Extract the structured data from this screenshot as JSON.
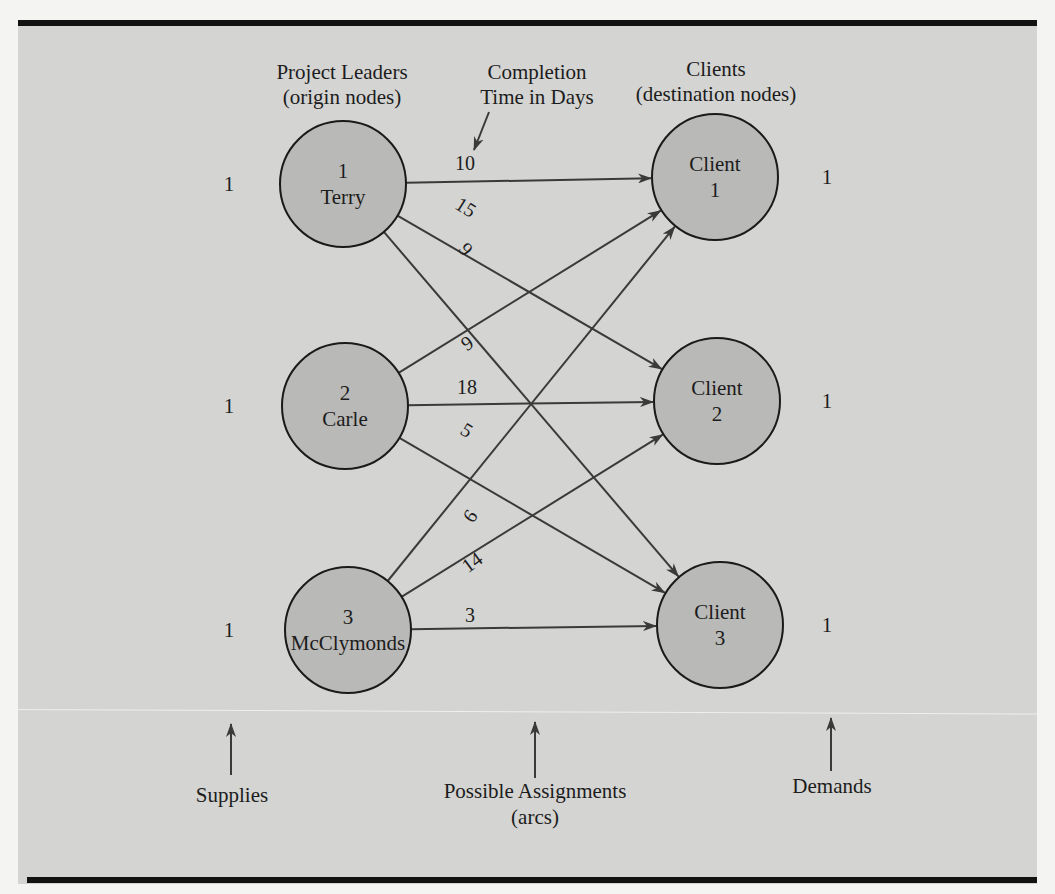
{
  "headers": {
    "origins_line1": "Project Leaders",
    "origins_line2": "(origin nodes)",
    "cost_line1": "Completion",
    "cost_line2": "Time in Days",
    "destinations_line1": "Clients",
    "destinations_line2": "(destination nodes)"
  },
  "origins": [
    {
      "id": "1",
      "name": "Terry",
      "supply": "1",
      "cx": 343,
      "cy": 184
    },
    {
      "id": "2",
      "name": "Carle",
      "supply": "1",
      "cx": 345,
      "cy": 406
    },
    {
      "id": "3",
      "name": "McClymonds",
      "supply": "1",
      "cx": 348,
      "cy": 630
    }
  ],
  "destinations": [
    {
      "label": "Client",
      "id": "1",
      "demand": "1",
      "cx": 715,
      "cy": 177
    },
    {
      "label": "Client",
      "id": "2",
      "demand": "1",
      "cx": 717,
      "cy": 401
    },
    {
      "label": "Client",
      "id": "3",
      "demand": "1",
      "cx": 720,
      "cy": 625
    }
  ],
  "arcs": [
    {
      "from": 0,
      "to": 0,
      "cost": "10",
      "lx": 465,
      "ly": 170,
      "rot": 0
    },
    {
      "from": 0,
      "to": 1,
      "cost": "15",
      "lx": 466,
      "ly": 214,
      "rot": 32
    },
    {
      "from": 0,
      "to": 2,
      "cost": "9",
      "lx": 466,
      "ly": 256,
      "rot": 50
    },
    {
      "from": 1,
      "to": 0,
      "cost": "9",
      "lx": 467,
      "ly": 350,
      "rot": -34
    },
    {
      "from": 1,
      "to": 1,
      "cost": "18",
      "lx": 467,
      "ly": 394,
      "rot": 0
    },
    {
      "from": 1,
      "to": 2,
      "cost": "5",
      "lx": 467,
      "ly": 437,
      "rot": 32
    },
    {
      "from": 2,
      "to": 0,
      "cost": "6",
      "lx": 470,
      "ly": 523,
      "rot": -55
    },
    {
      "from": 2,
      "to": 1,
      "cost": "14",
      "lx": 472,
      "ly": 569,
      "rot": -36
    },
    {
      "from": 2,
      "to": 2,
      "cost": "3",
      "lx": 470,
      "ly": 622,
      "rot": 0
    }
  ],
  "bottom_labels": {
    "supplies": "Supplies",
    "assignments_line1": "Possible Assignments",
    "assignments_line2": "(arcs)",
    "demands": "Demands"
  },
  "colors": {
    "background": "#d4d4d2",
    "node_fill": "#b9b9b7",
    "border": "#121212"
  },
  "chart_data": {
    "type": "network",
    "origins": [
      "Terry",
      "Carle",
      "McClymonds"
    ],
    "destinations": [
      "Client 1",
      "Client 2",
      "Client 3"
    ],
    "supplies": [
      1,
      1,
      1
    ],
    "demands": [
      1,
      1,
      1
    ],
    "cost_label": "Completion Time in Days",
    "costs": [
      [
        10,
        15,
        9
      ],
      [
        9,
        18,
        5
      ],
      [
        6,
        14,
        3
      ]
    ]
  }
}
